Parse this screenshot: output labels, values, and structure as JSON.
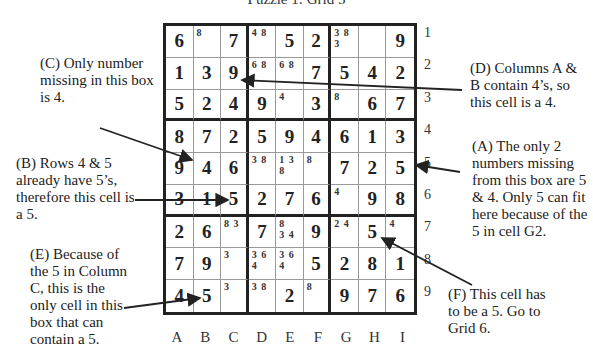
{
  "title": "Puzzle 1: Grid 5",
  "columns": [
    "A",
    "B",
    "C",
    "D",
    "E",
    "F",
    "G",
    "H",
    "I"
  ],
  "rows": [
    "1",
    "2",
    "3",
    "4",
    "5",
    "6",
    "7",
    "8",
    "9"
  ],
  "cells": [
    [
      {
        "v": "6"
      },
      {
        "c": "8"
      },
      {
        "v": "7"
      },
      {
        "c": "4 8"
      },
      {
        "v": "5"
      },
      {
        "v": "2"
      },
      {
        "c": "3 8 3"
      },
      {
        "v": ""
      },
      {
        "v": "9"
      }
    ],
    [
      {
        "v": "1"
      },
      {
        "v": "3"
      },
      {
        "v": "9"
      },
      {
        "c": "6 8"
      },
      {
        "c": "6 8"
      },
      {
        "v": "7"
      },
      {
        "v": "5"
      },
      {
        "v": "4"
      },
      {
        "v": "2"
      }
    ],
    [
      {
        "v": "5"
      },
      {
        "v": "2"
      },
      {
        "v": "4"
      },
      {
        "v": "9"
      },
      {
        "c": "4"
      },
      {
        "v": "3"
      },
      {
        "c": "8"
      },
      {
        "v": "6"
      },
      {
        "v": "7"
      }
    ],
    [
      {
        "v": "8"
      },
      {
        "v": "7"
      },
      {
        "v": "2"
      },
      {
        "v": "5"
      },
      {
        "v": "9"
      },
      {
        "v": "4"
      },
      {
        "v": "6"
      },
      {
        "v": "1"
      },
      {
        "v": "3"
      }
    ],
    [
      {
        "v": "9"
      },
      {
        "v": "4"
      },
      {
        "v": "6"
      },
      {
        "c": "3 8"
      },
      {
        "c": "1 3\n8"
      },
      {
        "c": "8"
      },
      {
        "v": "7"
      },
      {
        "v": "2"
      },
      {
        "v": "5"
      }
    ],
    [
      {
        "v": "3"
      },
      {
        "v": "1"
      },
      {
        "v": "5"
      },
      {
        "v": "2"
      },
      {
        "v": "7"
      },
      {
        "v": "6"
      },
      {
        "c": "4"
      },
      {
        "v": "9"
      },
      {
        "v": "8"
      }
    ],
    [
      {
        "v": "2"
      },
      {
        "v": "6"
      },
      {
        "c": "8 3"
      },
      {
        "v": "7"
      },
      {
        "c": "8\n3 4"
      },
      {
        "v": "9"
      },
      {
        "c": "2 4"
      },
      {
        "v": "5"
      },
      {
        "c": "4"
      }
    ],
    [
      {
        "v": "7"
      },
      {
        "v": "9"
      },
      {
        "c": "3"
      },
      {
        "c": "3 6\n4"
      },
      {
        "c": "3 6\n4"
      },
      {
        "v": "5"
      },
      {
        "v": "2"
      },
      {
        "v": "8"
      },
      {
        "v": "1"
      }
    ],
    [
      {
        "v": "4"
      },
      {
        "v": "5"
      },
      {
        "c": "3"
      },
      {
        "c": "3 8"
      },
      {
        "v": "2"
      },
      {
        "c": "8"
      },
      {
        "v": "9"
      },
      {
        "v": "7"
      },
      {
        "v": "6"
      }
    ]
  ],
  "notes": {
    "C": "(C) Only number missing in this box is 4.",
    "D": "(D) Columns A & B contain 4’s, so this cell is a 4.",
    "A": "(A) The only 2 numbers missing from this box are 5 & 4. Only 5 can fit here because of the 5 in cell G2.",
    "B": "(B) Rows 4 & 5 already have 5’s, therefore this cell is a 5.",
    "E": "(E) Because of the 5 in Column C, this is the only cell in this box that can contain a 5.",
    "F": "(F) This cell has to be a 5. Go to Grid 6."
  }
}
